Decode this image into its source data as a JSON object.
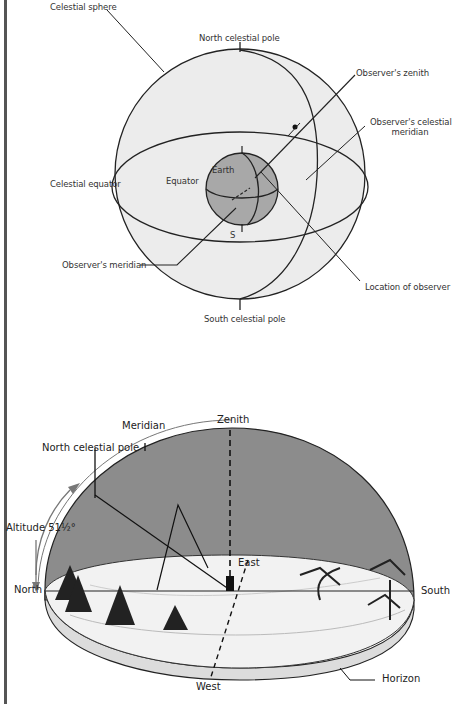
{
  "figure_top": {
    "title": "Celestial sphere diagram",
    "labels": {
      "celestial_sphere": "Celestial sphere",
      "north_celestial_pole": "North celestial pole",
      "observers_zenith": "Observer's zenith",
      "observers_celestial_meridian_line1": "Observer's celestial",
      "observers_celestial_meridian_line2": "meridian",
      "celestial_equator": "Celestial equator",
      "equator": "Equator",
      "earth": "Earth",
      "s": "S",
      "observers_meridian": "Observer's meridian",
      "location_of_observer": "Location of observer",
      "south_celestial_pole": "South celestial pole"
    },
    "colors": {
      "sphere_fill": "#ececec",
      "earth_fill": "#a8a8a8",
      "line": "#222222"
    }
  },
  "figure_bottom": {
    "title": "Horizon dome diagram",
    "labels": {
      "meridian": "Meridian",
      "zenith": "Zenith",
      "north_celestial_pole": "North celestial pole",
      "altitude": "Altitude 51½°",
      "east": "East",
      "north": "North",
      "south": "South",
      "west": "West",
      "horizon": "Horizon"
    },
    "colors": {
      "dome_fill": "#8c8c8c",
      "ground_fill": "#f2f2f2",
      "arrow": "#777777"
    }
  }
}
